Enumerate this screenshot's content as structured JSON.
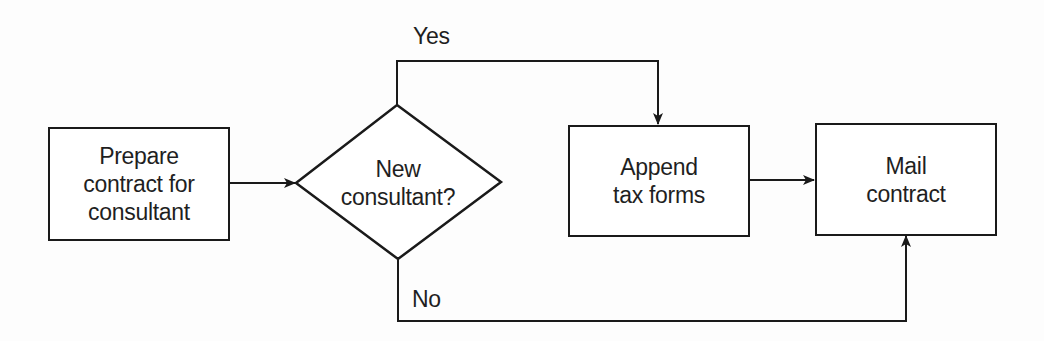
{
  "diagram": {
    "type": "flowchart",
    "nodes": {
      "prepare": {
        "label": "Prepare\ncontract for\nconsultant",
        "shape": "process"
      },
      "decision": {
        "label": "New\nconsultant?",
        "shape": "decision"
      },
      "append": {
        "label": "Append\ntax forms",
        "shape": "process"
      },
      "mail": {
        "label": "Mail\ncontract",
        "shape": "process"
      }
    },
    "edges": {
      "yes": {
        "label": "Yes",
        "from": "decision",
        "to": "append"
      },
      "no": {
        "label": "No",
        "from": "decision",
        "to": "mail"
      },
      "prepare_to_decision": {
        "from": "prepare",
        "to": "decision"
      },
      "append_to_mail": {
        "from": "append",
        "to": "mail"
      }
    },
    "colors": {
      "stroke": "#1a1a1a",
      "background": "#ffffff"
    }
  }
}
